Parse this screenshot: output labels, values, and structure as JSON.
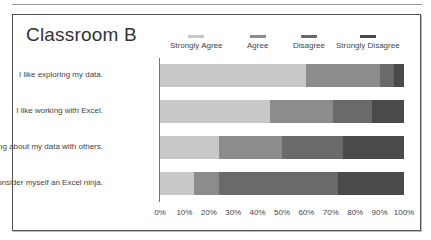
{
  "chart_data": {
    "type": "bar",
    "orientation": "horizontal",
    "stacked": "percent",
    "title": "Classroom B",
    "categories": [
      "I like exploring my data.",
      "I like working with Excel.",
      "I like talking about my data with others.",
      "I consider myself an Excel ninja."
    ],
    "series": [
      {
        "name": "Strongly Agree",
        "color": "#c8c8c8",
        "values": [
          60,
          45,
          24,
          14
        ]
      },
      {
        "name": "Agree",
        "color": "#8c8c8c",
        "values": [
          30,
          26,
          26,
          10
        ]
      },
      {
        "name": "Disagree",
        "color": "#6a6a6a",
        "values": [
          6,
          16,
          25,
          49
        ]
      },
      {
        "name": "Strongly Disagree",
        "color": "#4a4a4a",
        "values": [
          4,
          13,
          25,
          27
        ]
      }
    ],
    "xlabel": "",
    "ylabel": "",
    "xlim": [
      0,
      100
    ],
    "x_ticks": [
      "0%",
      "10%",
      "20%",
      "30%",
      "40%",
      "50%",
      "60%",
      "70%",
      "80%",
      "90%",
      "100%"
    ],
    "grid": false,
    "legend_position": "top"
  },
  "legend": {
    "items": [
      {
        "label": "Strongly Agree",
        "color": "#c8c8c8"
      },
      {
        "label": "Agree",
        "color": "#8c8c8c"
      },
      {
        "label": "Disagree",
        "color": "#6a6a6a"
      },
      {
        "label": "Strongly Disagree",
        "color": "#4a4a4a"
      }
    ]
  }
}
